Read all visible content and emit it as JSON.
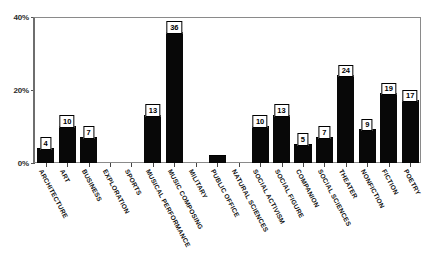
{
  "chart_data": {
    "type": "bar",
    "title": "",
    "subtitle": "",
    "xlabel": "",
    "ylabel": "",
    "ylim": [
      0,
      40
    ],
    "yticks": [
      "0%",
      "20%",
      "40%"
    ],
    "ytick_values": [
      0,
      20,
      40
    ],
    "grid": false,
    "legend": false,
    "value_labels": true,
    "categories": [
      "ARCHITECTURE",
      "ART",
      "BUSINESS",
      "EXPLORATION",
      "SPORTS",
      "MUSICAL PERFORMANCE",
      "MUSIC COMPOSING",
      "MILITARY",
      "PUBLIC OFFICE",
      "NATURAL SCIENCES",
      "SOCIAL ACTIVISM",
      "SOCIAL FIGURE",
      "COMPANION",
      "SOCIAL SCIENCES",
      "THEATER",
      "NONFICTION",
      "FICTION",
      "POETRY"
    ],
    "values": [
      4,
      10,
      7,
      0,
      0,
      13,
      36,
      0,
      2,
      0,
      10,
      13,
      5,
      7,
      24,
      9,
      19,
      17
    ],
    "labels": [
      "4",
      "10",
      "7",
      "",
      "",
      "13",
      "36",
      "",
      "",
      "",
      "10",
      "13",
      "5",
      "7",
      "24",
      "9",
      "19",
      "17"
    ],
    "bar_color": "#080808",
    "label_box_bg": "#ffffff",
    "label_box_border": "#000000",
    "axis_color": "#6e6e6e"
  }
}
